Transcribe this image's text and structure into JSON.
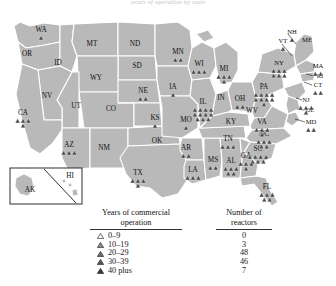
{
  "title": "years of operation by state",
  "map": {
    "name": "us-nuclear-reactor-map",
    "fill": "#b9b9b9",
    "border": "#ffffff",
    "marker_color": "#4a4a4a",
    "inset_label_ak": "AK",
    "inset_label_hi": "HI",
    "states": [
      {
        "abbr": "WA",
        "x": 41,
        "y": 22,
        "reactors": 1
      },
      {
        "abbr": "OR",
        "x": 27,
        "y": 46,
        "reactors": 0
      },
      {
        "abbr": "ID",
        "x": 58,
        "y": 55,
        "reactors": 0
      },
      {
        "abbr": "MT",
        "x": 92,
        "y": 36,
        "reactors": 0
      },
      {
        "abbr": "WY",
        "x": 96,
        "y": 70,
        "reactors": 0
      },
      {
        "abbr": "NV",
        "x": 47,
        "y": 88,
        "reactors": 0
      },
      {
        "abbr": "UT",
        "x": 76,
        "y": 98,
        "reactors": 0
      },
      {
        "abbr": "CO",
        "x": 111,
        "y": 101,
        "reactors": 0
      },
      {
        "abbr": "CA",
        "x": 23,
        "y": 105,
        "reactors": 4
      },
      {
        "abbr": "AZ",
        "x": 69,
        "y": 137,
        "reactors": 3
      },
      {
        "abbr": "NM",
        "x": 104,
        "y": 140,
        "reactors": 0
      },
      {
        "abbr": "ND",
        "x": 135,
        "y": 36,
        "reactors": 0
      },
      {
        "abbr": "SD",
        "x": 137,
        "y": 58,
        "reactors": 0
      },
      {
        "abbr": "NE",
        "x": 143,
        "y": 83,
        "reactors": 2
      },
      {
        "abbr": "KS",
        "x": 155,
        "y": 110,
        "reactors": 1
      },
      {
        "abbr": "OK",
        "x": 157,
        "y": 133,
        "reactors": 0
      },
      {
        "abbr": "TX",
        "x": 138,
        "y": 165,
        "reactors": 4
      },
      {
        "abbr": "MN",
        "x": 178,
        "y": 44,
        "reactors": 2
      },
      {
        "abbr": "IA",
        "x": 173,
        "y": 79,
        "reactors": 1
      },
      {
        "abbr": "MO",
        "x": 186,
        "y": 112,
        "reactors": 1
      },
      {
        "abbr": "AR",
        "x": 186,
        "y": 140,
        "reactors": 2
      },
      {
        "abbr": "LA",
        "x": 193,
        "y": 162,
        "reactors": 3
      },
      {
        "abbr": "WI",
        "x": 199,
        "y": 56,
        "reactors": 3
      },
      {
        "abbr": "IL",
        "x": 203,
        "y": 94,
        "reactors": 11
      },
      {
        "abbr": "MS",
        "x": 213,
        "y": 152,
        "reactors": 2
      },
      {
        "abbr": "AL",
        "x": 231,
        "y": 153,
        "reactors": 5
      },
      {
        "abbr": "TN",
        "x": 228,
        "y": 131,
        "reactors": 3
      },
      {
        "abbr": "KY",
        "x": 231,
        "y": 114,
        "reactors": 0
      },
      {
        "abbr": "IN",
        "x": 221,
        "y": 90,
        "reactors": 0
      },
      {
        "abbr": "MI",
        "x": 224,
        "y": 61,
        "reactors": 4
      },
      {
        "abbr": "OH",
        "x": 240,
        "y": 91,
        "reactors": 2
      },
      {
        "abbr": "WV",
        "x": 252,
        "y": 103,
        "reactors": 0
      },
      {
        "abbr": "VA",
        "x": 262,
        "y": 114,
        "reactors": 4
      },
      {
        "abbr": "NC",
        "x": 264,
        "y": 126,
        "reactors": 5
      },
      {
        "abbr": "SC",
        "x": 258,
        "y": 141,
        "reactors": 7
      },
      {
        "abbr": "GA",
        "x": 246,
        "y": 148,
        "reactors": 4
      },
      {
        "abbr": "FL",
        "x": 267,
        "y": 179,
        "reactors": 5
      },
      {
        "abbr": "PA",
        "x": 264,
        "y": 79,
        "reactors": 9
      },
      {
        "abbr": "NY",
        "x": 279,
        "y": 55,
        "reactors": 6
      },
      {
        "abbr": "VT",
        "x": 283,
        "y": 33,
        "reactors": 1
      },
      {
        "abbr": "NH",
        "x": 292,
        "y": 24,
        "reactors": 1
      },
      {
        "abbr": "ME",
        "x": 307,
        "y": 32,
        "reactors": 0
      },
      {
        "abbr": "MA",
        "x": 318,
        "y": 58,
        "reactors": 2
      },
      {
        "abbr": "RI",
        "x": 320,
        "y": 68,
        "reactors": 0
      },
      {
        "abbr": "CT",
        "x": 318,
        "y": 77,
        "reactors": 2
      },
      {
        "abbr": "NJ",
        "x": 306,
        "y": 92,
        "reactors": 4
      },
      {
        "abbr": "DE",
        "x": 310,
        "y": 102,
        "reactors": 0
      },
      {
        "abbr": "MD",
        "x": 311,
        "y": 114,
        "reactors": 2
      }
    ]
  },
  "legend": {
    "left_heading_line1": "Years of commercial",
    "left_heading_line2": "operation",
    "right_heading_line1": "Number of",
    "right_heading_line2": "reactors",
    "rows": [
      {
        "marker": "open-triangle-icon",
        "range": "0–9",
        "count": "0",
        "shade": "#ffffff"
      },
      {
        "marker": "filled-triangle-icon",
        "range": "10–19",
        "count": "3",
        "shade": "#8c8c8c"
      },
      {
        "marker": "filled-triangle-icon",
        "range": "20–29",
        "count": "48",
        "shade": "#6e6e6e"
      },
      {
        "marker": "filled-triangle-icon",
        "range": "30–39",
        "count": "46",
        "shade": "#555555"
      },
      {
        "marker": "filled-triangle-icon",
        "range": "40 plus",
        "count": "7",
        "shade": "#3a3a3a"
      }
    ]
  }
}
